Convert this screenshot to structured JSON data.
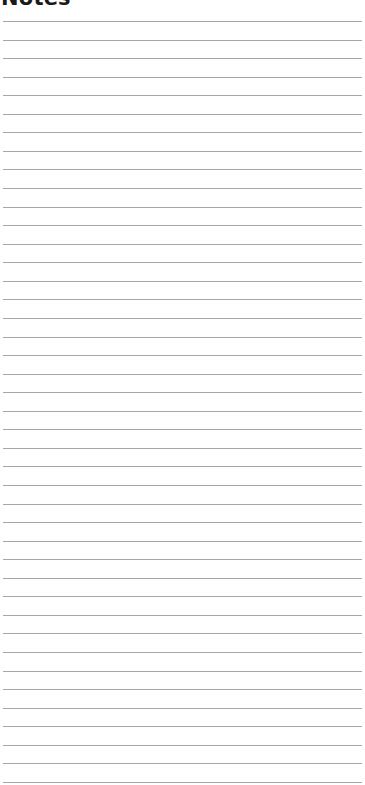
{
  "header": {
    "title": "Notes"
  },
  "notes_area": {
    "line_count": 42,
    "first_line_y": 21,
    "line_spacing": 18.56,
    "line_color": "#a6a6a6",
    "lines": []
  }
}
